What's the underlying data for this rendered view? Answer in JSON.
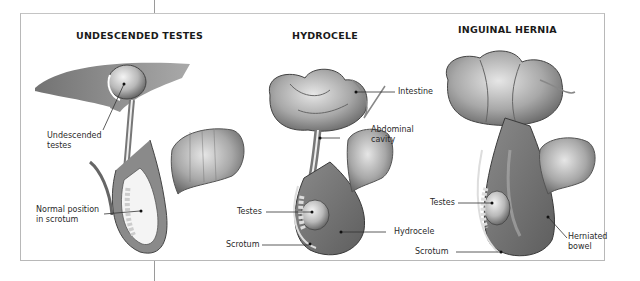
{
  "panels": [
    {
      "title": "UNDESCENDED TESTES",
      "labels": {
        "undescended_line1": "Undescended",
        "undescended_line2": "testes",
        "normal_line1": "Normal position",
        "normal_line2": "in scrotum"
      }
    },
    {
      "title": "HYDROCELE",
      "labels": {
        "intestine": "Intestine",
        "abdominal_line1": "Abdominal",
        "abdominal_line2": "cavity",
        "testes": "Testes",
        "hydrocele": "Hydrocele",
        "scrotum": "Scrotum"
      }
    },
    {
      "title": "INGUINAL HERNIA",
      "labels": {
        "testes": "Testes",
        "herniated_line1": "Herniated",
        "herniated_line2": "bowel",
        "scrotum": "Scrotum"
      }
    }
  ],
  "colors": {
    "tissue_dark": "#6e6e6e",
    "tissue_mid": "#9a9a9a",
    "tissue_light": "#d0d0d0",
    "frame": "#b8b8b8"
  }
}
